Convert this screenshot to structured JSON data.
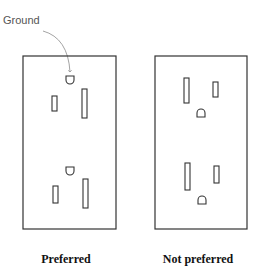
{
  "labels": {
    "ground": "Ground",
    "preferred": "Preferred",
    "not_preferred": "Not preferred"
  },
  "outlets": [
    {
      "name": "preferred",
      "orientation": "ground-up",
      "box": {
        "x": 23,
        "y": 56,
        "w": 93,
        "h": 173
      },
      "receptacles": [
        {
          "ground": {
            "x": 66,
            "y": 75
          },
          "neutral_slot": {
            "x": 82,
            "y": 89,
            "w": 5,
            "h": 29
          },
          "hot_slot": {
            "x": 52,
            "y": 96,
            "w": 5,
            "h": 15
          }
        },
        {
          "ground": {
            "x": 66,
            "y": 166
          },
          "neutral_slot": {
            "x": 83,
            "y": 179,
            "w": 5,
            "h": 29
          },
          "hot_slot": {
            "x": 53,
            "y": 186,
            "w": 5,
            "h": 17
          }
        }
      ]
    },
    {
      "name": "not-preferred",
      "orientation": "ground-down",
      "box": {
        "x": 155,
        "y": 56,
        "w": 92,
        "h": 173
      },
      "receptacles": [
        {
          "ground": {
            "x": 197,
            "y": 109
          },
          "neutral_slot": {
            "x": 184,
            "y": 78,
            "w": 5,
            "h": 25
          },
          "hot_slot": {
            "x": 213,
            "y": 82,
            "w": 5,
            "h": 15
          }
        },
        {
          "ground": {
            "x": 198,
            "y": 196
          },
          "neutral_slot": {
            "x": 185,
            "y": 163,
            "w": 5,
            "h": 27
          },
          "hot_slot": {
            "x": 214,
            "y": 166,
            "w": 5,
            "h": 17
          }
        }
      ]
    }
  ],
  "colors": {
    "stroke": "#333333",
    "arrow": "#888888",
    "background": "#ffffff"
  }
}
